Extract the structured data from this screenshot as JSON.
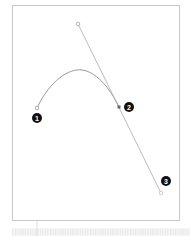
{
  "diagram": {
    "colors": {
      "frame": "#c8c8c8",
      "curve": "#9a9a9a",
      "handle_line": "#aaaaaa",
      "badge_fill": "#111111",
      "badge_text": "#ffffff",
      "ruler": "#e6e6e6"
    },
    "points": [
      {
        "id": "1",
        "label": "1",
        "x": 37,
        "y": 108,
        "badge_x": 37,
        "badge_y": 117
      },
      {
        "id": "2",
        "label": "2",
        "x": 119,
        "y": 107,
        "badge_x": 129,
        "badge_y": 107
      },
      {
        "id": "3",
        "label": "3",
        "x": 161,
        "y": 193,
        "badge_x": 166,
        "badge_y": 181
      }
    ],
    "handle_top": {
      "x": 78,
      "y": 24
    },
    "labels": [
      "1",
      "2",
      "3"
    ]
  }
}
